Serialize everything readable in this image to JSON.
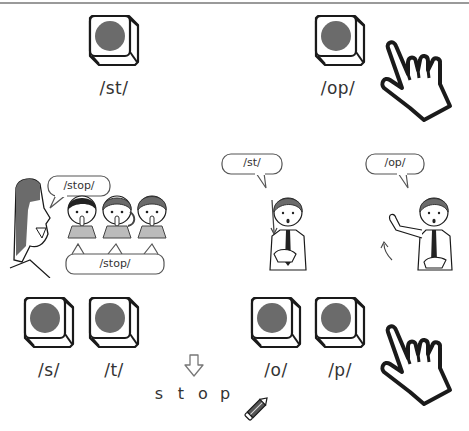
{
  "top_row": {
    "left_button": {
      "label": "/st/"
    },
    "right_button": {
      "label": "/op/"
    }
  },
  "middle_row": {
    "teacher_bubble": "/stop/",
    "students_bubble": "/stop/",
    "gesture_left_bubble": "/st/",
    "gesture_right_bubble": "/op/"
  },
  "bottom_row": {
    "buttons": [
      {
        "label": "/s/"
      },
      {
        "label": "/t/"
      },
      {
        "label": "/o/"
      },
      {
        "label": "/p/"
      }
    ],
    "word_letters": [
      "s",
      "t",
      "o",
      "p"
    ]
  },
  "colors": {
    "button_circle": "#6b6b6b",
    "hair": "#6b6b6b",
    "outline": "#1a1a1a",
    "top_rule": "#9a9a9a"
  }
}
